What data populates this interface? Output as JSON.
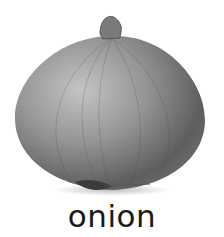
{
  "image": {
    "subject": "onion",
    "style": "grayscale photo"
  },
  "caption": {
    "text": "onion"
  },
  "colors": {
    "background": "#ffffff",
    "caption_text": "#1a1a1a",
    "onion_light": "#b8b8b8",
    "onion_dark": "#555555"
  }
}
